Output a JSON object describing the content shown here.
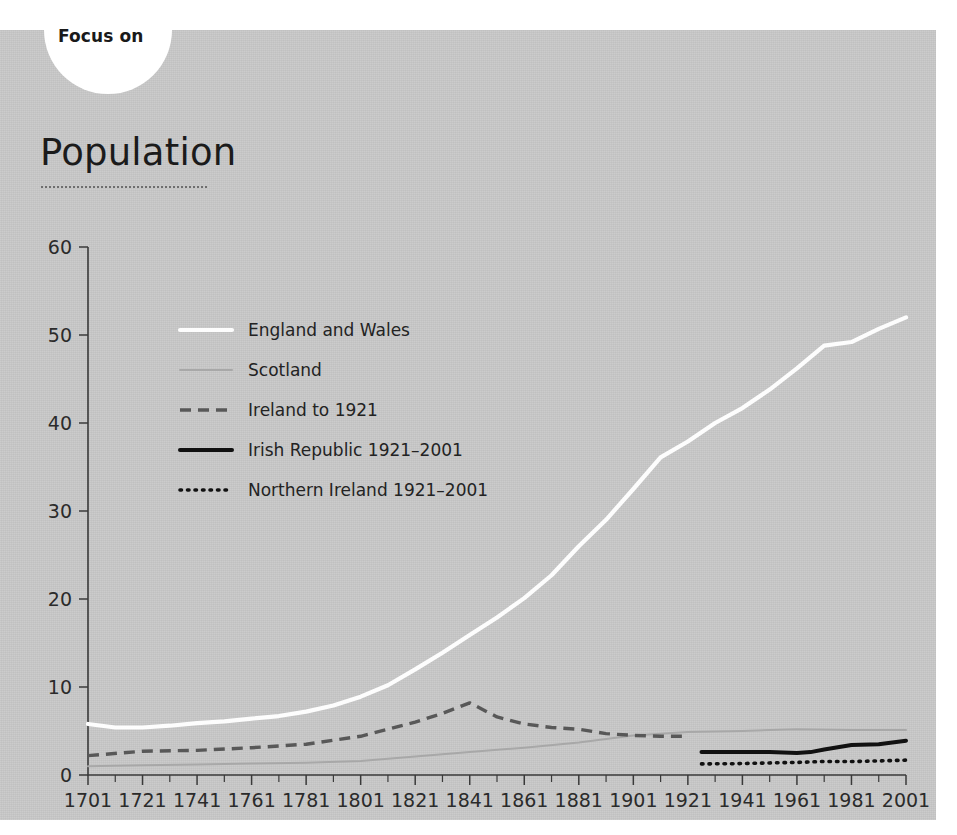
{
  "header": {
    "kicker": "Focus on",
    "title": "Population"
  },
  "chart_data": {
    "type": "line",
    "title": "Population",
    "xlabel": "",
    "ylabel": "",
    "ylim": [
      0,
      60
    ],
    "yticks": [
      0,
      10,
      20,
      30,
      40,
      50,
      60
    ],
    "xlim": [
      1701,
      2001
    ],
    "xticks": [
      1701,
      1721,
      1741,
      1761,
      1781,
      1801,
      1821,
      1841,
      1861,
      1881,
      1901,
      1921,
      1941,
      1961,
      1981,
      2001
    ],
    "minor_xticks": [
      1711,
      1731,
      1751,
      1771,
      1791,
      1811,
      1831,
      1851,
      1871,
      1891,
      1911,
      1931,
      1951,
      1971,
      1991
    ],
    "grid": false,
    "legend_position": "upper left inside",
    "units": "millions",
    "series": [
      {
        "name": "England and Wales",
        "key": "england_and_wales",
        "color": "#fdfdfd",
        "style": "solid",
        "x": [
          1701,
          1711,
          1721,
          1731,
          1741,
          1751,
          1761,
          1771,
          1781,
          1791,
          1801,
          1811,
          1821,
          1831,
          1841,
          1851,
          1861,
          1871,
          1881,
          1891,
          1901,
          1911,
          1921,
          1931,
          1941,
          1951,
          1961,
          1971,
          1981,
          1991,
          2001
        ],
        "values": [
          5.8,
          5.4,
          5.4,
          5.6,
          5.9,
          6.1,
          6.4,
          6.7,
          7.2,
          7.9,
          8.9,
          10.2,
          12.0,
          13.9,
          15.9,
          17.9,
          20.1,
          22.7,
          26.0,
          29.0,
          32.5,
          36.1,
          37.9,
          40.0,
          41.7,
          43.8,
          46.2,
          48.8,
          49.2,
          50.7,
          52.0
        ]
      },
      {
        "name": "Scotland",
        "key": "scotland",
        "color": "#a8a8a8",
        "style": "solid",
        "x": [
          1701,
          1721,
          1741,
          1761,
          1781,
          1801,
          1821,
          1841,
          1861,
          1881,
          1901,
          1921,
          1941,
          1961,
          1981,
          2001
        ],
        "values": [
          1.0,
          1.1,
          1.2,
          1.3,
          1.4,
          1.6,
          2.1,
          2.6,
          3.1,
          3.7,
          4.5,
          4.9,
          5.0,
          5.2,
          5.1,
          5.1
        ]
      },
      {
        "name": "Ireland to 1921",
        "key": "ireland_to_1921",
        "color": "#585858",
        "style": "dashed",
        "x": [
          1701,
          1721,
          1741,
          1761,
          1781,
          1801,
          1821,
          1831,
          1841,
          1851,
          1861,
          1871,
          1881,
          1891,
          1901,
          1911,
          1921
        ],
        "values": [
          2.2,
          2.7,
          2.8,
          3.1,
          3.5,
          4.4,
          6.0,
          7.0,
          8.2,
          6.6,
          5.8,
          5.4,
          5.2,
          4.7,
          4.5,
          4.4,
          4.4
        ]
      },
      {
        "name": "Irish Republic 1921–2001",
        "key": "irish_republic",
        "color": "#111111",
        "style": "solid",
        "x": [
          1926,
          1936,
          1946,
          1951,
          1961,
          1966,
          1971,
          1981,
          1991,
          2001
        ],
        "values": [
          2.6,
          2.6,
          2.6,
          2.6,
          2.5,
          2.6,
          2.9,
          3.4,
          3.5,
          3.9
        ]
      },
      {
        "name": "Northern Ireland 1921–2001",
        "key": "northern_ireland",
        "color": "#111111",
        "style": "dotted",
        "x": [
          1926,
          1937,
          1951,
          1961,
          1971,
          1981,
          1991,
          2001
        ],
        "values": [
          1.26,
          1.28,
          1.37,
          1.43,
          1.54,
          1.53,
          1.6,
          1.69
        ]
      }
    ]
  },
  "legend": {
    "items": [
      {
        "label": "England and Wales"
      },
      {
        "label": "Scotland"
      },
      {
        "label": "Ireland to 1921"
      },
      {
        "label": "Irish Republic 1921–2001"
      },
      {
        "label": "Northern Ireland 1921–2001"
      }
    ]
  },
  "colors": {
    "panel_background": "#c8c8c8",
    "page_background": "#ffffff",
    "axis": "#3a3a3a",
    "text": "#232323"
  }
}
